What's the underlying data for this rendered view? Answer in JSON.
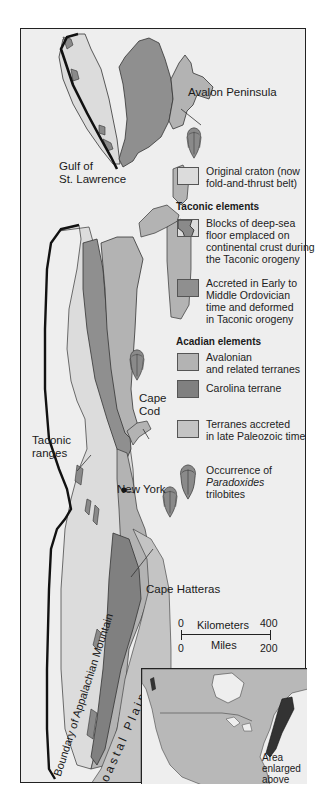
{
  "figure": {
    "colors": {
      "background": "#eeeeee",
      "craton": "#dcdcdc",
      "deep_sea_blocks": "#8a8a8a",
      "accreted_ordovician": "#8f8f8f",
      "avalonian": "#b3b3b3",
      "carolina": "#808080",
      "late_paleozoic": "#c4c4c4",
      "outline": "#222222"
    }
  },
  "map_labels": {
    "avalon": "Avalon Peninsula",
    "gulf_line1": "Gulf of",
    "gulf_line2": "St. Lawrence",
    "cape_cod_line1": "Cape",
    "cape_cod_line2": "Cod",
    "taconic_line1": "Taconic",
    "taconic_line2": "ranges",
    "new_york": "New York",
    "cape_hatteras": "Cape Hatteras",
    "boundary": "Boundary of Appalachian Mountain",
    "coastal_plain": "Coastal Plain"
  },
  "legend": {
    "craton": {
      "line1": "Original craton (now",
      "line2": "fold-and-thrust belt)"
    },
    "taconic_header": "Taconic elements",
    "deep_sea": {
      "line1": "Blocks of deep-sea",
      "line2": "floor emplaced on",
      "line3": "continental crust during",
      "line4": "the Taconic orogeny"
    },
    "accreted": {
      "line1": "Accreted in Early to",
      "line2": "Middle Ordovician",
      "line3": "time and deformed",
      "line4": "in Taconic orogeny"
    },
    "acadian_header": "Acadian elements",
    "avalonian": {
      "line1": "Avalonian",
      "line2": "and related terranes"
    },
    "carolina": {
      "line1": "Carolina terrane"
    },
    "late_paleozoic": {
      "line1": "Terranes accreted",
      "line2": "in late Paleozoic time"
    },
    "trilobite": {
      "line1": "Occurrence of",
      "line2": "Paradoxides",
      "line3": "trilobites"
    }
  },
  "scale_bar": {
    "km_label": "Kilometers",
    "km_start": "0",
    "km_end": "400",
    "mi_label": "Miles",
    "mi_start": "0",
    "mi_end": "200"
  },
  "inset": {
    "caption_line1": "Area",
    "caption_line2": "enlarged",
    "caption_line3": "above"
  }
}
